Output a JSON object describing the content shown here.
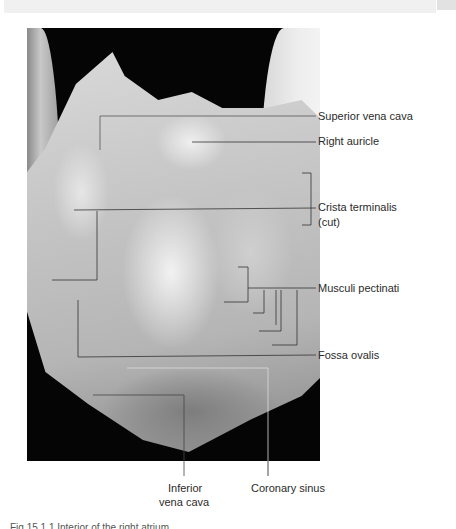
{
  "figure": {
    "caption": "Fig 15.1.1  Interior of the right atrium",
    "colors": {
      "background": "#ffffff",
      "photo_bg": "#050505",
      "line": "#333333",
      "text": "#2b2b2b"
    }
  },
  "labels": {
    "superior_vena_cava": "Superior vena cava",
    "right_auricle": "Right auricle",
    "crista_terminalis_1": "Crista terminalis",
    "crista_terminalis_2": "(cut)",
    "musculi_pectinati": "Musculi pectinati",
    "fossa_ovalis": "Fossa ovalis",
    "inferior_vena_cava_1": "Inferior",
    "inferior_vena_cava_2": "vena cava",
    "coronary_sinus": "Coronary sinus"
  }
}
